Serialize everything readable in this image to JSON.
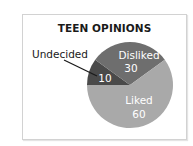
{
  "chart_data": {
    "type": "pie",
    "title": "TEEN OPINIONS",
    "categories": [
      "Undecided",
      "Disliked",
      "Liked"
    ],
    "values": [
      10,
      30,
      60
    ],
    "colors": [
      "#4a4a4a",
      "#6e6e6e",
      "#a9a9a9"
    ],
    "label_color_inside": "#ffffff",
    "label_color_outside": "#1a1a1a",
    "legend": "none (labels on slices; Undecided uses external label with leader line)"
  },
  "labels": {
    "undecided_name": "Undecided",
    "undecided_value": "10",
    "disliked_name": "Disliked",
    "disliked_value": "30",
    "liked_name": "Liked",
    "liked_value": "60"
  }
}
